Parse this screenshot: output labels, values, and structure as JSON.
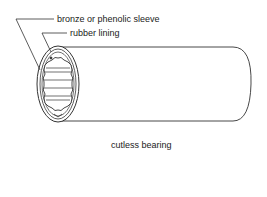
{
  "diagram": {
    "caption": "cutless bearing",
    "labels": [
      {
        "id": "sleeve",
        "text": "bronze or phenolic sleeve"
      },
      {
        "id": "lining",
        "text": "rubber lining"
      }
    ],
    "colors": {
      "line": "#333333",
      "background": "#ffffff"
    }
  }
}
